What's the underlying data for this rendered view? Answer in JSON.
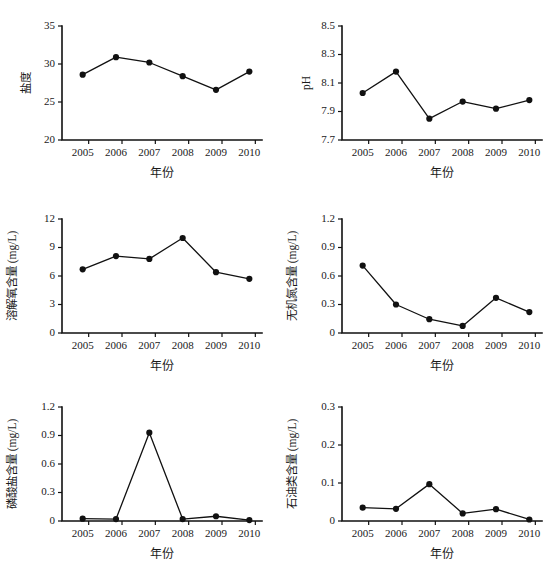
{
  "figure": {
    "background": "#ffffff",
    "ink_color": "#111111",
    "panel_count": 6,
    "grid": "2 columns x 3 rows"
  },
  "chart_data": [
    {
      "id": "salinity",
      "type": "line",
      "title": "",
      "xlabel": "年份",
      "ylabel": "盐度",
      "categories": [
        "2005",
        "2006",
        "2007",
        "2008",
        "2009",
        "2010"
      ],
      "values": [
        28.6,
        30.9,
        30.2,
        28.4,
        26.6,
        29.0
      ],
      "yticks": [
        "20",
        "25",
        "30",
        "35"
      ],
      "ytick_values": [
        20,
        25,
        30,
        35
      ],
      "ylim": [
        20,
        35
      ],
      "grid": "off",
      "legend": "none",
      "marker": "filled-circle"
    },
    {
      "id": "ph",
      "type": "line",
      "title": "",
      "xlabel": "年份",
      "ylabel": "pH",
      "categories": [
        "2005",
        "2006",
        "2007",
        "2008",
        "2009",
        "2010"
      ],
      "values": [
        8.03,
        8.18,
        7.85,
        7.97,
        7.92,
        7.98
      ],
      "yticks": [
        "7.7",
        "7.9",
        "8.1",
        "8.3",
        "8.5"
      ],
      "ytick_values": [
        7.7,
        7.9,
        8.1,
        8.3,
        8.5
      ],
      "ylim": [
        7.7,
        8.5
      ],
      "grid": "off",
      "legend": "none",
      "marker": "filled-circle"
    },
    {
      "id": "dissolved-oxygen",
      "type": "line",
      "title": "",
      "xlabel": "年份",
      "ylabel": "溶解氧含量 (mg/L)",
      "categories": [
        "2005",
        "2006",
        "2007",
        "2008",
        "2009",
        "2010"
      ],
      "values": [
        6.7,
        8.1,
        7.8,
        10.0,
        6.4,
        5.7
      ],
      "yticks": [
        "0",
        "3",
        "6",
        "9",
        "12"
      ],
      "ytick_values": [
        0,
        3,
        6,
        9,
        12
      ],
      "ylim": [
        0,
        12
      ],
      "grid": "off",
      "legend": "none",
      "marker": "filled-circle"
    },
    {
      "id": "inorganic-nitrogen",
      "type": "line",
      "title": "",
      "xlabel": "年份",
      "ylabel": "无机氮含量 (mg/L)",
      "categories": [
        "2005",
        "2006",
        "2007",
        "2008",
        "2009",
        "2010"
      ],
      "values": [
        0.71,
        0.3,
        0.145,
        0.075,
        0.37,
        0.22
      ],
      "yticks": [
        "0",
        "0.3",
        "0.6",
        "0.9",
        "1.2"
      ],
      "ytick_values": [
        0,
        0.3,
        0.6,
        0.9,
        1.2
      ],
      "ylim": [
        0,
        1.2
      ],
      "grid": "off",
      "legend": "none",
      "marker": "filled-circle"
    },
    {
      "id": "phosphate",
      "type": "line",
      "title": "",
      "xlabel": "年份",
      "ylabel": "磷酸盐含量 (mg/L)",
      "categories": [
        "2005",
        "2006",
        "2007",
        "2008",
        "2009",
        "2010"
      ],
      "values": [
        0.025,
        0.02,
        0.93,
        0.02,
        0.05,
        0.01
      ],
      "yticks": [
        "0",
        "0.3",
        "0.6",
        "0.9",
        "1.2"
      ],
      "ytick_values": [
        0,
        0.3,
        0.6,
        0.9,
        1.2
      ],
      "ylim": [
        0,
        1.2
      ],
      "grid": "off",
      "legend": "none",
      "marker": "filled-circle"
    },
    {
      "id": "petroleum",
      "type": "line",
      "title": "",
      "xlabel": "年份",
      "ylabel": "石油类含量 (mg/L)",
      "categories": [
        "2005",
        "2006",
        "2007",
        "2008",
        "2009",
        "2010"
      ],
      "values": [
        0.035,
        0.032,
        0.097,
        0.02,
        0.031,
        0.004
      ],
      "yticks": [
        "0",
        "0.1",
        "0.2",
        "0.3"
      ],
      "ytick_values": [
        0,
        0.1,
        0.2,
        0.3
      ],
      "ylim": [
        0,
        0.3
      ],
      "grid": "off",
      "legend": "none",
      "marker": "filled-circle"
    }
  ]
}
